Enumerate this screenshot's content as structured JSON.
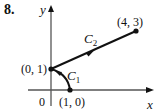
{
  "problem_number": "8.",
  "axes": {
    "x_label": "x",
    "y_label": "y",
    "origin_label": "0"
  },
  "points": [
    {
      "label": "(0, 1)",
      "x": 0,
      "y": 1
    },
    {
      "label": "(1, 0)",
      "x": 1,
      "y": 0
    },
    {
      "label": "(4, 3)",
      "x": 4,
      "y": 3
    }
  ],
  "curves": [
    {
      "name": "C",
      "sub": "1",
      "description": "arc from (1, 0) to (0, 1)",
      "from": "(1, 0)",
      "to": "(0, 1)"
    },
    {
      "name": "C",
      "sub": "2",
      "description": "line segment from (0, 1) to (4, 3)",
      "from": "(0, 1)",
      "to": "(4, 3)"
    }
  ],
  "colors": {
    "ink": "#111111",
    "axis": "#555555"
  }
}
